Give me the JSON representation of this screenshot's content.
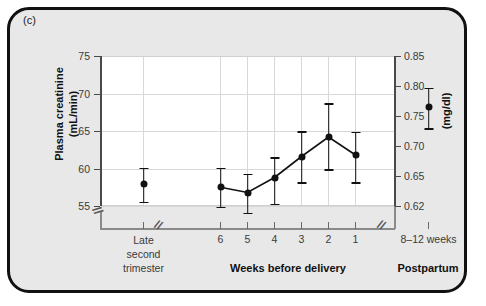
{
  "panel": {
    "label": "(c)"
  },
  "chart_data": {
    "type": "scatter",
    "title": "",
    "subtitle": "",
    "ylabel": "Plasma creatinine\n(mL/min)",
    "ylabel_line1": "Plasma creatinine",
    "ylabel_line2": "(mL/min)",
    "ylabel_right": "(mg/dl)",
    "xlabel": "",
    "ylim": [
      55,
      75
    ],
    "yticks": [
      75,
      70,
      65,
      60,
      55
    ],
    "ytick_labels": [
      "75",
      "70",
      "65",
      "60",
      "55"
    ],
    "yticks_right_labels": [
      "0.85",
      "0.80",
      "0.75",
      "0.70",
      "0.65",
      "0.62"
    ],
    "yticks_right_values": [
      0.85,
      0.8,
      0.75,
      0.7,
      0.65,
      0.62
    ],
    "grid": true,
    "legend": "none",
    "axis_breaks": [
      "y-axis below 55",
      "x-axis between late second trimester and week 6",
      "x-axis between week 1 and postpartum"
    ],
    "break_glyph": "//",
    "groups": [
      {
        "name": "late-second-trimester",
        "group_label": "",
        "tick_label_lines": [
          "Late",
          "second",
          "trimester"
        ]
      },
      {
        "name": "weeks-before-delivery",
        "group_label": "Weeks before delivery",
        "tick_label_lines": [
          "6",
          "5",
          "4",
          "3",
          "2",
          "1"
        ]
      },
      {
        "name": "postpartum",
        "group_label": "Postpartum",
        "tick_label_lines": [
          "8–12 weeks"
        ]
      }
    ],
    "categories": [
      "Late second trimester",
      "6",
      "5",
      "4",
      "3",
      "2",
      "1",
      "8–12 weeks"
    ],
    "values": [
      57.9,
      57.5,
      56.8,
      58.8,
      61.6,
      64.2,
      61.8,
      68.2
    ],
    "errors_low": [
      55.6,
      54.9,
      54.1,
      55.3,
      58.2,
      59.9,
      58.2,
      65.4
    ],
    "errors_high": [
      60.1,
      60.1,
      59.3,
      61.5,
      65.0,
      68.7,
      64.9,
      70.8
    ],
    "values_mg_dl": [
      0.645,
      0.641,
      0.632,
      0.654,
      0.688,
      0.72,
      0.69,
      0.775
    ],
    "connected_indices": [
      1,
      2,
      3,
      4,
      5,
      6
    ],
    "marker": "filled-circle",
    "marker_color": "#111111",
    "error_bar_color": "#111111",
    "plot_background": "#ffffff",
    "panel_background": "#e8e8e8",
    "grid_color": "#d8d8d8"
  }
}
